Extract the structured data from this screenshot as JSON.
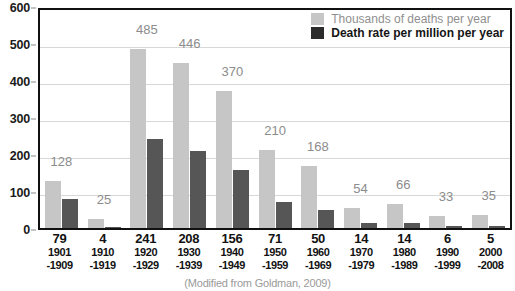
{
  "chart_data": {
    "type": "bar",
    "title": "",
    "xlabel": "",
    "ylabel": "",
    "ylim": [
      0,
      600
    ],
    "ytick_step": 100,
    "yticks": [
      0,
      100,
      200,
      300,
      400,
      500,
      600
    ],
    "grid": true,
    "legend_position": "top-right",
    "categories": [
      "1901-1909",
      "1910-1919",
      "1920-1929",
      "1930-1939",
      "1940-1949",
      "1950-1959",
      "1960-1969",
      "1970-1979",
      "1980-1989",
      "1990-1999",
      "2000-2008"
    ],
    "category_lines": [
      {
        "year_start": "1901",
        "year_end": "-1909"
      },
      {
        "year_start": "1910",
        "year_end": "-1919"
      },
      {
        "year_start": "1920",
        "year_end": "-1929"
      },
      {
        "year_start": "1930",
        "year_end": "-1939"
      },
      {
        "year_start": "1940",
        "year_end": "-1949"
      },
      {
        "year_start": "1950",
        "year_end": "-1959"
      },
      {
        "year_start": "1960",
        "year_end": "-1969"
      },
      {
        "year_start": "1970",
        "year_end": "-1979"
      },
      {
        "year_start": "1980",
        "year_end": "-1989"
      },
      {
        "year_start": "1990",
        "year_end": "-1999"
      },
      {
        "year_start": "2000",
        "year_end": "-2008"
      }
    ],
    "series": [
      {
        "name": "Thousands of deaths per year",
        "color": "#c6c6c6",
        "values": [
          128,
          25,
          485,
          446,
          370,
          210,
          168,
          54,
          66,
          33,
          35
        ],
        "labels_shown": true
      },
      {
        "name": "Death rate per million per year",
        "color": "#565656",
        "values": [
          79,
          4,
          241,
          208,
          156,
          71,
          50,
          14,
          14,
          6,
          5
        ],
        "labels_shown": false,
        "labels_location": "x-axis"
      }
    ],
    "caption": "(Modified from Goldman, 2009)"
  },
  "legend": {
    "items": [
      {
        "label": "Thousands of deaths per year",
        "swatch": "light"
      },
      {
        "label": "Death rate per million per year",
        "swatch": "dark"
      }
    ]
  },
  "colors": {
    "series_light": "#c6c6c6",
    "series_dark": "#565656",
    "legend_dark_swatch": "#2b2b2b",
    "axis": "#111111",
    "gridline": "#d8d8d8",
    "value_label": "#8c8c8c",
    "tick_label": "#1a1a1a"
  }
}
